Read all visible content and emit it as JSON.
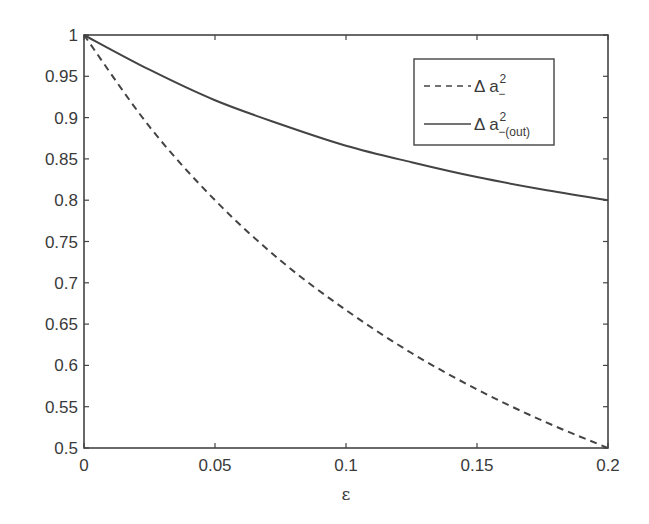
{
  "chart_data": {
    "type": "line",
    "title": "",
    "xlabel": "ε",
    "ylabel": "",
    "xlim": [
      0,
      0.2
    ],
    "ylim": [
      0.5,
      1
    ],
    "grid": false,
    "legend_position": "upper right (inside)",
    "x_ticks": [
      "0",
      "0.05",
      "0.1",
      "0.15",
      "0.2"
    ],
    "y_ticks": [
      "0.5",
      "0.55",
      "0.6",
      "0.65",
      "0.7",
      "0.75",
      "0.8",
      "0.85",
      "0.9",
      "0.95",
      "1"
    ],
    "x": [
      0,
      0.025,
      0.05,
      0.075,
      0.1,
      0.125,
      0.15,
      0.175,
      0.2
    ],
    "series": [
      {
        "name": "Δ a²₋",
        "legend_main": "Δ a",
        "legend_sup": "2",
        "legend_sub": "−",
        "style": "dashed",
        "color": "#444444",
        "values": [
          1.0,
          0.889,
          0.8,
          0.727,
          0.667,
          0.615,
          0.571,
          0.533,
          0.5
        ]
      },
      {
        "name": "Δ a²₋(out)",
        "legend_main": "Δ a",
        "legend_sup": "2",
        "legend_sub": "−(out)",
        "style": "solid",
        "color": "#444444",
        "values": [
          1.0,
          0.958,
          0.921,
          0.892,
          0.866,
          0.846,
          0.828,
          0.813,
          0.8
        ]
      }
    ]
  },
  "colors": {
    "axis": "#444444",
    "background": "#ffffff",
    "text": "#3a3a3a"
  }
}
